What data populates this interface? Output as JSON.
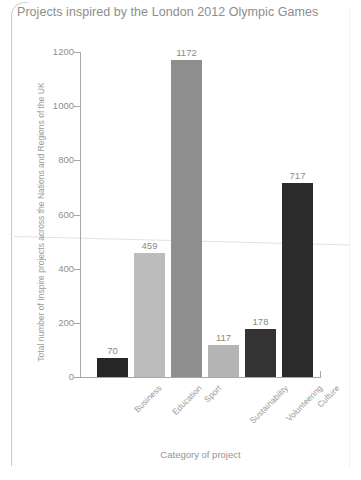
{
  "chart_data": {
    "type": "bar",
    "title": "Projects inspired by the London 2012 Olympic Games",
    "xlabel": "Category of project",
    "ylabel": "Total number of Inspire projects across the Nations and Regions of the UK",
    "categories": [
      "Business",
      "Education",
      "Sport",
      "Sustainability",
      "Volunteering",
      "Culture"
    ],
    "values": [
      70,
      459,
      1172,
      117,
      178,
      717
    ],
    "bar_colors": [
      "#262626",
      "#bcbcbc",
      "#8e8e8e",
      "#b4b4b4",
      "#333333",
      "#2b2b2b"
    ],
    "ylim": [
      0,
      1200
    ],
    "yticks": [
      0,
      200,
      400,
      600,
      800,
      1000,
      1200
    ],
    "ytick_labels": [
      "0",
      "200",
      "400",
      "600",
      "800",
      "1000",
      "1200"
    ],
    "grid": false,
    "legend": "none",
    "data_labels": [
      "70",
      "459",
      "1172",
      "117",
      "178",
      "717"
    ]
  },
  "colors": {
    "title": "#8d8d8d",
    "axis": "#a8a8a8",
    "tick_text": "#8f8f8f",
    "background": "#ffffff"
  }
}
